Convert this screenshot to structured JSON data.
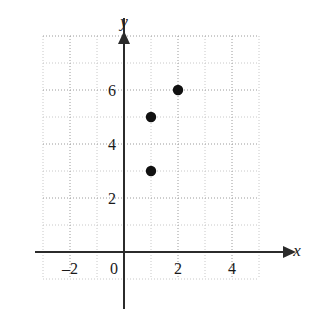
{
  "chart_data": {
    "type": "scatter",
    "title": "",
    "xlabel": "x",
    "ylabel": "y",
    "points": [
      {
        "x": 1,
        "y": 3
      },
      {
        "x": 1,
        "y": 5
      },
      {
        "x": 2,
        "y": 6
      }
    ],
    "xlim": [
      -3.7,
      5.9
    ],
    "ylim": [
      -1.3,
      8.1
    ],
    "xticks": [
      -2,
      0,
      2,
      4
    ],
    "xtick_labels": [
      "–2",
      "0",
      "2",
      "4"
    ],
    "yticks": [
      2,
      4,
      6
    ],
    "ytick_labels": [
      "2",
      "4",
      "6"
    ],
    "grid": true,
    "grid_major_step": 2,
    "grid_minor_step": 1,
    "legend": null,
    "axis_arrows": true,
    "colors": {
      "point": "#111111",
      "axis": "#2b2b2b",
      "grid_major": "#9a9a9a",
      "grid_minor": "#c8c8c8",
      "background": "#ffffff"
    }
  },
  "figure": {
    "x_axis_arrow_label": "x",
    "y_axis_arrow_label": "y"
  }
}
